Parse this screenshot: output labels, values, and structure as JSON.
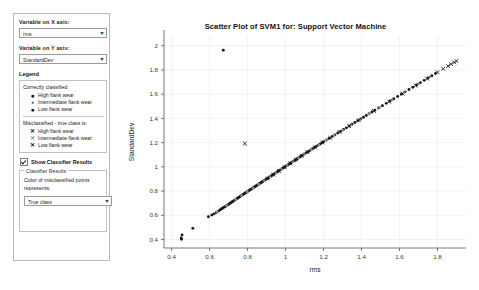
{
  "panel": {
    "x_axis_label": "Variable on X axis:",
    "x_axis_value": "rms",
    "y_axis_label": "Variable on Y axis:",
    "y_axis_value": "StandardDev",
    "legend_title": "Legend",
    "legend_groups": [
      {
        "head": "Correctly classified",
        "items": [
          {
            "symbol": "●",
            "label": "High flank wear"
          },
          {
            "symbol": "●",
            "label": "Intermediate flank wear"
          },
          {
            "symbol": "●",
            "label": "Low flank wear"
          }
        ]
      },
      {
        "head": "Misclassified - true class is:",
        "items": [
          {
            "symbol": "✕",
            "label": "High flank wear"
          },
          {
            "symbol": "✕",
            "label": "Intermediate flank wear"
          },
          {
            "symbol": "✕",
            "label": "Low flank wear"
          }
        ]
      }
    ],
    "show_classifier_results": "Show Classifier Results",
    "classifier_group_title": "Classifier Results",
    "classifier_group_text": "Color of misclassified points represents:",
    "classifier_select_value": "True class"
  },
  "chart_data": {
    "type": "scatter",
    "title": "Scatter Plot of SVM1 for: Support Vector Machine",
    "xlabel": "rms",
    "ylabel": "StandardDev",
    "xlim": [
      0.36,
      1.95
    ],
    "ylim": [
      0.33,
      2.08
    ],
    "xticks": [
      0.4,
      0.6,
      0.8,
      1,
      1.2,
      1.4,
      1.6,
      1.8
    ],
    "yticks": [
      0.4,
      0.6,
      0.8,
      1,
      1.2,
      1.4,
      1.6,
      1.8,
      2
    ],
    "xticklabels": [
      "0.4",
      "0.6",
      "0.8",
      "1",
      "1.2",
      "1.4",
      "1.6",
      "1.8"
    ],
    "yticklabels": [
      "0.4",
      "0.6",
      "0.8",
      "1",
      "1.2",
      "1.4",
      "1.6",
      "1.8",
      "2"
    ],
    "grid": true,
    "legend": "external-panel",
    "series": [
      {
        "name": "Correctly classified",
        "marker": "dot",
        "color": "#1a1a1a",
        "points": [
          [
            0.452,
            0.402
          ],
          [
            0.455,
            0.438
          ],
          [
            0.451,
            0.412
          ],
          [
            0.512,
            0.492
          ],
          [
            0.594,
            0.588
          ],
          [
            0.612,
            0.602
          ],
          [
            0.624,
            0.612
          ],
          [
            0.636,
            0.624
          ],
          [
            0.648,
            0.636
          ],
          [
            0.655,
            0.645
          ],
          [
            0.662,
            0.652
          ],
          [
            0.668,
            0.658
          ],
          [
            0.674,
            0.664
          ],
          [
            0.681,
            0.671
          ],
          [
            0.688,
            0.678
          ],
          [
            0.694,
            0.684
          ],
          [
            0.7,
            0.69
          ],
          [
            0.706,
            0.697
          ],
          [
            0.712,
            0.704
          ],
          [
            0.718,
            0.71
          ],
          [
            0.723,
            0.715
          ],
          [
            0.729,
            0.722
          ],
          [
            0.735,
            0.728
          ],
          [
            0.741,
            0.734
          ],
          [
            0.747,
            0.741
          ],
          [
            0.753,
            0.747
          ],
          [
            0.759,
            0.753
          ],
          [
            0.764,
            0.759
          ],
          [
            0.77,
            0.765
          ],
          [
            0.776,
            0.771
          ],
          [
            0.782,
            0.778
          ],
          [
            0.788,
            0.784
          ],
          [
            0.794,
            0.79
          ],
          [
            0.8,
            0.796
          ],
          [
            0.806,
            0.802
          ],
          [
            0.812,
            0.809
          ],
          [
            0.818,
            0.815
          ],
          [
            0.824,
            0.821
          ],
          [
            0.83,
            0.827
          ],
          [
            0.836,
            0.834
          ],
          [
            0.842,
            0.84
          ],
          [
            0.848,
            0.846
          ],
          [
            0.854,
            0.852
          ],
          [
            0.86,
            0.858
          ],
          [
            0.866,
            0.865
          ],
          [
            0.872,
            0.871
          ],
          [
            0.878,
            0.877
          ],
          [
            0.884,
            0.883
          ],
          [
            0.89,
            0.889
          ],
          [
            0.896,
            0.896
          ],
          [
            0.902,
            0.902
          ],
          [
            0.908,
            0.908
          ],
          [
            0.914,
            0.914
          ],
          [
            0.92,
            0.921
          ],
          [
            0.926,
            0.927
          ],
          [
            0.932,
            0.933
          ],
          [
            0.938,
            0.939
          ],
          [
            0.944,
            0.946
          ],
          [
            0.95,
            0.952
          ],
          [
            0.956,
            0.958
          ],
          [
            0.962,
            0.964
          ],
          [
            0.968,
            0.97
          ],
          [
            0.974,
            0.977
          ],
          [
            0.98,
            0.983
          ],
          [
            0.986,
            0.989
          ],
          [
            0.992,
            0.995
          ],
          [
            0.998,
            1.001
          ],
          [
            1.004,
            1.008
          ],
          [
            1.01,
            1.014
          ],
          [
            1.016,
            1.02
          ],
          [
            1.022,
            1.026
          ],
          [
            1.028,
            1.032
          ],
          [
            1.034,
            1.039
          ],
          [
            1.04,
            1.045
          ],
          [
            1.046,
            1.051
          ],
          [
            1.052,
            1.057
          ],
          [
            1.058,
            1.063
          ],
          [
            1.064,
            1.07
          ],
          [
            1.07,
            1.076
          ],
          [
            1.076,
            1.082
          ],
          [
            1.082,
            1.088
          ],
          [
            1.088,
            1.094
          ],
          [
            1.094,
            1.101
          ],
          [
            1.1,
            1.107
          ],
          [
            1.11,
            1.117
          ],
          [
            1.12,
            1.127
          ],
          [
            1.13,
            1.137
          ],
          [
            1.14,
            1.147
          ],
          [
            1.15,
            1.157
          ],
          [
            1.16,
            1.167
          ],
          [
            1.17,
            1.177
          ],
          [
            1.18,
            1.187
          ],
          [
            1.19,
            1.197
          ],
          [
            1.2,
            1.207
          ],
          [
            1.215,
            1.221
          ],
          [
            1.23,
            1.235
          ],
          [
            1.245,
            1.25
          ],
          [
            1.26,
            1.264
          ],
          [
            1.275,
            1.279
          ],
          [
            1.29,
            1.293
          ],
          [
            1.305,
            1.308
          ],
          [
            1.32,
            1.322
          ],
          [
            1.335,
            1.337
          ],
          [
            1.35,
            1.351
          ],
          [
            1.365,
            1.366
          ],
          [
            1.38,
            1.38
          ],
          [
            1.395,
            1.395
          ],
          [
            1.41,
            1.409
          ],
          [
            1.425,
            1.424
          ],
          [
            1.44,
            1.438
          ],
          [
            1.455,
            1.453
          ],
          [
            1.47,
            1.467
          ],
          [
            1.49,
            1.486
          ],
          [
            1.51,
            1.505
          ],
          [
            1.53,
            1.524
          ],
          [
            1.55,
            1.543
          ],
          [
            1.57,
            1.562
          ],
          [
            1.59,
            1.581
          ],
          [
            1.61,
            1.6
          ],
          [
            1.63,
            1.619
          ],
          [
            1.65,
            1.638
          ],
          [
            1.67,
            1.657
          ],
          [
            1.69,
            1.676
          ],
          [
            1.71,
            1.695
          ],
          [
            1.73,
            1.714
          ],
          [
            1.75,
            1.733
          ],
          [
            1.77,
            1.752
          ],
          [
            1.79,
            1.771
          ],
          [
            0.672,
            1.962
          ]
        ]
      },
      {
        "name": "Correctly classified (intermediate, gray)",
        "marker": "dot",
        "color": "#8a8a8a",
        "points": [
          [
            0.64,
            0.63
          ],
          [
            0.69,
            0.68
          ],
          [
            0.736,
            0.73
          ],
          [
            0.768,
            0.762
          ],
          [
            0.798,
            0.795
          ],
          [
            0.828,
            0.825
          ],
          [
            0.858,
            0.857
          ],
          [
            0.888,
            0.886
          ],
          [
            0.918,
            0.918
          ],
          [
            0.948,
            0.949
          ],
          [
            0.978,
            0.98
          ],
          [
            1.008,
            1.011
          ],
          [
            1.038,
            1.042
          ],
          [
            1.068,
            1.073
          ],
          [
            1.098,
            1.104
          ],
          [
            1.135,
            1.141
          ],
          [
            1.175,
            1.181
          ],
          [
            1.215,
            1.22
          ],
          [
            1.255,
            1.259
          ],
          [
            1.3,
            1.303
          ],
          [
            1.345,
            1.346
          ],
          [
            1.39,
            1.39
          ],
          [
            1.44,
            1.438
          ],
          [
            1.495,
            1.49
          ],
          [
            1.56,
            1.552
          ],
          [
            1.625,
            1.614
          ],
          [
            1.7,
            1.686
          ],
          [
            1.76,
            1.743
          ]
        ]
      },
      {
        "name": "Misclassified",
        "marker": "x",
        "color": "#1a1a1a",
        "points": [
          [
            0.786,
            1.192
          ],
          [
            0.905,
            0.905
          ],
          [
            0.935,
            0.936
          ],
          [
            0.965,
            0.967
          ],
          [
            0.995,
            0.998
          ],
          [
            1.025,
            1.029
          ],
          [
            1.055,
            1.06
          ],
          [
            1.085,
            1.091
          ],
          [
            1.115,
            1.121
          ],
          [
            1.155,
            1.161
          ],
          [
            1.195,
            1.201
          ],
          [
            1.235,
            1.24
          ],
          [
            1.285,
            1.288
          ],
          [
            1.335,
            1.336
          ],
          [
            1.385,
            1.385
          ],
          [
            1.465,
            1.462
          ],
          [
            1.545,
            1.538
          ],
          [
            1.615,
            1.605
          ],
          [
            1.685,
            1.671
          ],
          [
            1.745,
            1.728
          ],
          [
            1.8,
            1.781
          ],
          [
            1.83,
            1.809
          ],
          [
            1.855,
            1.832
          ],
          [
            1.872,
            1.848
          ],
          [
            1.888,
            1.862
          ],
          [
            1.9,
            1.873
          ]
        ]
      }
    ]
  }
}
